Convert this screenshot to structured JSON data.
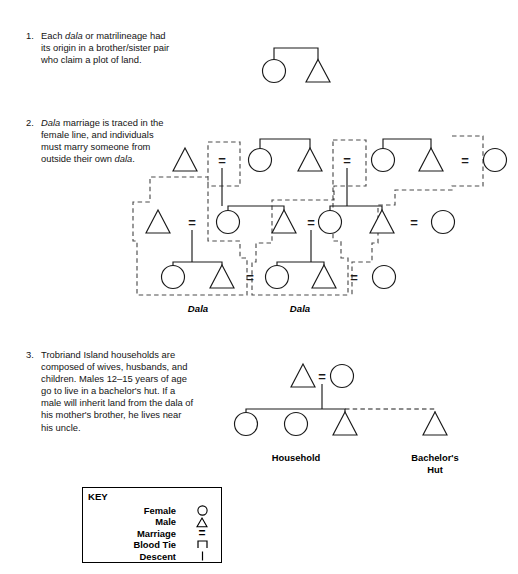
{
  "notes": [
    {
      "number": "1.",
      "segments": [
        {
          "text": "Each ",
          "italic": false
        },
        {
          "text": "dala",
          "italic": true
        },
        {
          "text": " or matrilineage had its origin in a brother/sister pair who claim a plot of land.",
          "italic": false
        }
      ]
    },
    {
      "number": "2.",
      "segments": [
        {
          "text": "Dala",
          "italic": true
        },
        {
          "text": " marriage is traced in the female line, and individuals must marry someone from outside their own ",
          "italic": false
        },
        {
          "text": "dala",
          "italic": true
        },
        {
          "text": ".",
          "italic": false
        }
      ]
    },
    {
      "number": "3.",
      "segments": [
        {
          "text": "Trobriand Island households are composed of wives, husbands, and children. Males 12–15 years of age go to live in a bachelor's hut. If a male will inherit land from the dala of his mother's brother, he lives near his uncle.",
          "italic": false
        }
      ]
    }
  ],
  "diagram1": {
    "name": "brother-sister-pair",
    "marriage_symbols": [],
    "people": [
      {
        "id": "d1-f1",
        "sex": "female",
        "shape": "circle",
        "x": 274,
        "y": 71
      },
      {
        "id": "d1-m1",
        "sex": "male",
        "shape": "triangle",
        "x": 318,
        "y": 71
      }
    ],
    "sibling_bracket": {
      "left_x": 274,
      "right_x": 318,
      "top_y": 48,
      "drop_y": 60
    }
  },
  "diagram2": {
    "name": "dala-marriage-lineages",
    "rows": [
      {
        "row": "top",
        "y": 160,
        "people": [
          {
            "id": "g1-m-in",
            "sex": "male",
            "shape": "triangle",
            "x": 185,
            "y": 160
          },
          {
            "id": "g1-f1",
            "sex": "female",
            "shape": "circle",
            "x": 260,
            "y": 160
          },
          {
            "id": "g1-m1",
            "sex": "male",
            "shape": "triangle",
            "x": 310,
            "y": 160
          },
          {
            "id": "g1-f2",
            "sex": "female",
            "shape": "circle",
            "x": 383,
            "y": 160
          },
          {
            "id": "g1-m2",
            "sex": "male",
            "shape": "triangle",
            "x": 431,
            "y": 160
          },
          {
            "id": "g1-f3",
            "sex": "female",
            "shape": "circle",
            "x": 495,
            "y": 160
          }
        ],
        "marriages": [
          {
            "x": 222,
            "y": 160
          },
          {
            "x": 347,
            "y": 160
          },
          {
            "x": 465,
            "y": 160
          }
        ]
      },
      {
        "row": "middle",
        "y": 222,
        "people": [
          {
            "id": "g2-m-in",
            "sex": "male",
            "shape": "triangle",
            "x": 158,
            "y": 222
          },
          {
            "id": "g2-f1",
            "sex": "female",
            "shape": "circle",
            "x": 228,
            "y": 222
          },
          {
            "id": "g2-m1",
            "sex": "male",
            "shape": "triangle",
            "x": 284,
            "y": 222
          },
          {
            "id": "g2-f2",
            "sex": "female",
            "shape": "circle",
            "x": 330,
            "y": 222
          },
          {
            "id": "g2-m2",
            "sex": "male",
            "shape": "triangle",
            "x": 382,
            "y": 222
          },
          {
            "id": "g2-f3",
            "sex": "female",
            "shape": "circle",
            "x": 443,
            "y": 222
          }
        ],
        "marriages": [
          {
            "x": 192,
            "y": 222
          },
          {
            "x": 311,
            "y": 222
          },
          {
            "x": 414,
            "y": 222
          }
        ]
      },
      {
        "row": "bottom",
        "y": 277,
        "people": [
          {
            "id": "g3-f1",
            "sex": "female",
            "shape": "circle",
            "x": 173,
            "y": 277
          },
          {
            "id": "g3-m1",
            "sex": "male",
            "shape": "triangle",
            "x": 222,
            "y": 277
          },
          {
            "id": "g3-f2",
            "sex": "female",
            "shape": "circle",
            "x": 277,
            "y": 277
          },
          {
            "id": "g3-m2",
            "sex": "male",
            "shape": "triangle",
            "x": 324,
            "y": 277
          },
          {
            "id": "g3-f3",
            "sex": "female",
            "shape": "circle",
            "x": 384,
            "y": 277
          }
        ],
        "marriages": [
          {
            "x": 250,
            "y": 277
          },
          {
            "x": 354,
            "y": 277
          }
        ]
      }
    ],
    "dala_labels": [
      {
        "text": "Dala",
        "x": 198,
        "y": 304
      },
      {
        "text": "Dala",
        "x": 300,
        "y": 304
      }
    ]
  },
  "diagram3": {
    "name": "trobriand-household",
    "people": [
      {
        "id": "h-father",
        "sex": "male",
        "shape": "triangle",
        "x": 303,
        "y": 376
      },
      {
        "id": "h-mother",
        "sex": "female",
        "shape": "circle",
        "x": 342,
        "y": 376
      },
      {
        "id": "h-child1",
        "sex": "female",
        "shape": "circle",
        "x": 246,
        "y": 424
      },
      {
        "id": "h-child2",
        "sex": "female",
        "shape": "circle",
        "x": 296,
        "y": 424
      },
      {
        "id": "h-child3",
        "sex": "male",
        "shape": "triangle",
        "x": 345,
        "y": 424
      },
      {
        "id": "h-bachelor",
        "sex": "male",
        "shape": "triangle",
        "x": 435,
        "y": 424
      }
    ],
    "marriages": [
      {
        "x": 322,
        "y": 376
      }
    ],
    "captions": [
      {
        "text": "Household",
        "x": 296,
        "y": 452
      },
      {
        "text": "Bachelor's\nHut",
        "x": 435,
        "y": 452
      }
    ]
  },
  "key": {
    "title": "KEY",
    "rows": [
      {
        "label": "Female",
        "symbol": "circle-icon"
      },
      {
        "label": "Male",
        "symbol": "triangle-icon"
      },
      {
        "label": "Marriage",
        "symbol": "equals-icon"
      },
      {
        "label": "Blood Tie",
        "symbol": "bracket-icon"
      },
      {
        "label": "Descent",
        "symbol": "vertical-line-icon"
      }
    ]
  },
  "colors": {
    "ink": "#1a1a1a",
    "dashed": "#4d4d4d",
    "paper": "#ffffff"
  }
}
